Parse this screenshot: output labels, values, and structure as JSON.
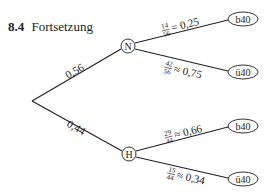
{
  "heading": {
    "number": "8.4",
    "title": "Fortsetzung"
  },
  "tree": {
    "root": {
      "x": 32,
      "y": 101
    },
    "level1": [
      {
        "id": "N",
        "label": "N",
        "x": 128,
        "y": 46,
        "edge_label": "0,56"
      },
      {
        "id": "H",
        "label": "H",
        "x": 129,
        "y": 154,
        "edge_label": "0,44"
      }
    ],
    "leaves": [
      {
        "parent": "N",
        "label": "b40",
        "x": 243,
        "y": 19,
        "frac_num": "14",
        "frac_den": "56",
        "relation": "=",
        "value": "0,25"
      },
      {
        "parent": "N",
        "label": "ü40",
        "x": 243,
        "y": 72,
        "frac_num": "42",
        "frac_den": "56",
        "relation": "≈",
        "value": "0,75"
      },
      {
        "parent": "H",
        "label": "b40",
        "x": 243,
        "y": 126,
        "frac_num": "29",
        "frac_den": "44",
        "relation": "≈",
        "value": "0,66"
      },
      {
        "parent": "H",
        "label": "ü40",
        "x": 243,
        "y": 179,
        "frac_num": "15",
        "frac_den": "44",
        "relation": "≈",
        "value": "0,34"
      }
    ]
  }
}
